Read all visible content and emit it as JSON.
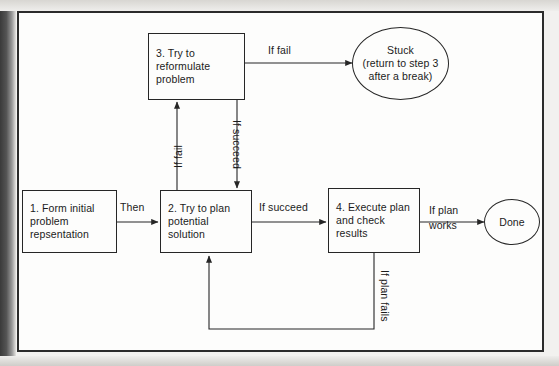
{
  "diagram": {
    "stroke_color": "#262626",
    "text_color": "#1b1b1b",
    "background_color": "#fdfdfc",
    "frame_color": "#2b2b2b",
    "nodes": [
      {
        "id": "step1",
        "shape": "rect",
        "label": "1. Form initial problem repsentation",
        "lines": [
          "1. Form initial",
          "problem",
          "repsentation"
        ]
      },
      {
        "id": "step2",
        "shape": "rect",
        "label": "2. Try to plan potential solution",
        "lines": [
          "2. Try to plan",
          "potential",
          "solution"
        ]
      },
      {
        "id": "step3",
        "shape": "rect",
        "label": "3. Try to reformulate problem",
        "lines": [
          "3. Try to",
          "reformulate",
          "problem"
        ]
      },
      {
        "id": "step4",
        "shape": "rect",
        "label": "4. Execute plan and check results",
        "lines": [
          "4. Execute plan",
          "and check",
          "results"
        ]
      },
      {
        "id": "stuck",
        "shape": "ellipse",
        "label": "Stuck (return to step 3 after a break)",
        "lines": [
          "Stuck",
          "(return to step 3",
          "after a break)"
        ]
      },
      {
        "id": "done",
        "shape": "ellipse",
        "label": "Done",
        "lines": [
          "Done"
        ]
      }
    ],
    "edges": [
      {
        "id": "e1",
        "from": "step1",
        "to": "step2",
        "label": "Then",
        "orientation": "horizontal"
      },
      {
        "id": "e2",
        "from": "step2",
        "to": "step4",
        "label": "If succeed",
        "orientation": "horizontal"
      },
      {
        "id": "e3",
        "from": "step4",
        "to": "done",
        "label": "If plan works",
        "orientation": "horizontal",
        "lines": [
          "If plan",
          "works"
        ]
      },
      {
        "id": "e4",
        "from": "step3",
        "to": "stuck",
        "label": "If fail",
        "orientation": "horizontal"
      },
      {
        "id": "e5",
        "from": "step2",
        "to": "step3",
        "label": "If fail",
        "orientation": "vertical-up"
      },
      {
        "id": "e6",
        "from": "step3",
        "to": "step2",
        "label": "If succeed",
        "orientation": "vertical-down"
      },
      {
        "id": "e7",
        "from": "step4",
        "to": "step2",
        "label": "If plan fails",
        "orientation": "feedback-loop"
      }
    ]
  }
}
